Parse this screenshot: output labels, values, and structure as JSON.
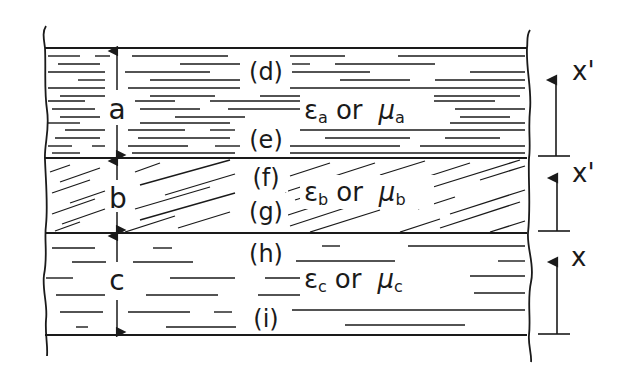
{
  "diagram": {
    "type": "layered-medium-cross-section",
    "ink_color": "#1a1a1a",
    "background": "#ffffff",
    "layers": [
      {
        "id": "a",
        "thickness_label": "a",
        "hatch": "horizontal-dense",
        "top_point_label": "(d)",
        "bottom_point_label": "(e)",
        "property_label": {
          "epsilon": "ε",
          "sub": "a",
          "or": "or",
          "mu": "μ",
          "mu_sub": "a"
        },
        "coordinate_label": "x'"
      },
      {
        "id": "b",
        "thickness_label": "b",
        "hatch": "diagonal",
        "top_point_label": "(f)",
        "bottom_point_label": "(g)",
        "property_label": {
          "epsilon": "ε",
          "sub": "b",
          "or": "or",
          "mu": "μ",
          "mu_sub": "b"
        },
        "coordinate_label": "x'"
      },
      {
        "id": "c",
        "thickness_label": "c",
        "hatch": "horizontal-sparse",
        "top_point_label": "(h)",
        "bottom_point_label": "(i)",
        "property_label": {
          "epsilon": "ε",
          "sub": "c",
          "or": "or",
          "mu": "μ",
          "mu_sub": "c"
        },
        "coordinate_label": "x"
      }
    ]
  }
}
